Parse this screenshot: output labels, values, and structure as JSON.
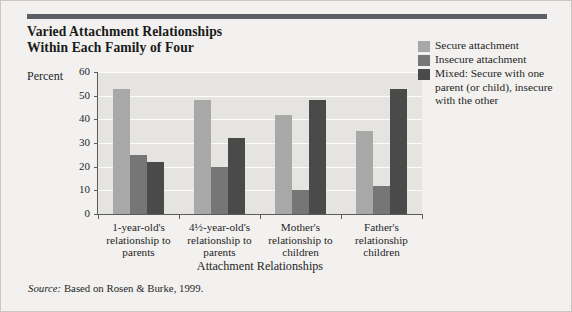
{
  "title": {
    "line1": "Varied Attachment Relationships",
    "line2": "Within Each Family of Four"
  },
  "axis": {
    "y_label": "Percent",
    "x_label": "Attachment Relationships",
    "y_ticks": [
      "0",
      "10",
      "20",
      "30",
      "40",
      "50",
      "60"
    ]
  },
  "legend": [
    {
      "label": "Secure attachment",
      "color": "#a8a8a8"
    },
    {
      "label": "Insecure attachment",
      "color": "#767676"
    },
    {
      "label": "Mixed: Secure with one parent (or child), insecure with the other",
      "color": "#4a4a4a"
    }
  ],
  "source": {
    "prefix": "Source:",
    "text": " Based on Rosen & Burke, 1999."
  },
  "chart_data": {
    "type": "bar",
    "title": "Varied Attachment Relationships Within Each Family of Four",
    "xlabel": "Attachment Relationships",
    "ylabel": "Percent",
    "ylim": [
      0,
      60
    ],
    "ytick_step": 10,
    "grid": true,
    "legend_position": "right",
    "categories": [
      "1-year-old's relationship to parents",
      "4½-year-old's relationship to parents",
      "Mother's relationship to children",
      "Father's relationship to children"
    ],
    "category_lines": [
      [
        "1-year-old's",
        "relationship to",
        "parents"
      ],
      [
        "4½-year-old's",
        "relationship to",
        "parents"
      ],
      [
        "Mother's",
        "relationship to",
        "children"
      ],
      [
        "Father's",
        "relationship",
        "children"
      ]
    ],
    "series": [
      {
        "name": "Secure attachment",
        "color": "#a8a8a8",
        "values": [
          53,
          48,
          42,
          35
        ]
      },
      {
        "name": "Insecure attachment",
        "color": "#767676",
        "values": [
          25,
          20,
          10,
          12
        ]
      },
      {
        "name": "Mixed: Secure with one parent (or child), insecure with the other",
        "color": "#4a4a4a",
        "values": [
          22,
          32,
          48,
          53
        ]
      }
    ]
  }
}
